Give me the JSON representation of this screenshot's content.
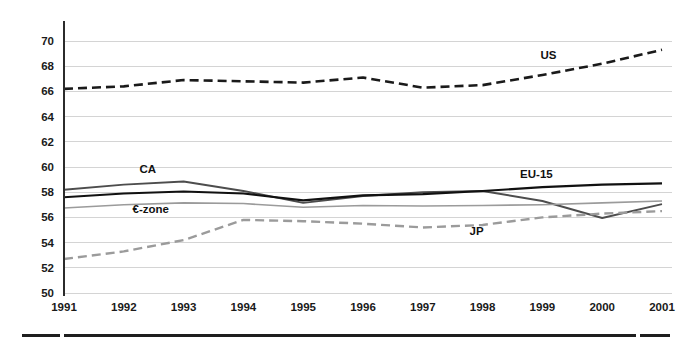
{
  "chart_data": {
    "type": "line",
    "title": "",
    "subtitle": "",
    "xlabel": "",
    "ylabel": "",
    "x": [
      1991,
      1992,
      1993,
      1994,
      1995,
      1996,
      1997,
      1998,
      1999,
      2000,
      2001
    ],
    "categories": [
      "1991",
      "1992",
      "1993",
      "1994",
      "1995",
      "1996",
      "1997",
      "1998",
      "1999",
      "2000",
      "2001"
    ],
    "xlim": [
      1991,
      2001
    ],
    "ylim": [
      50,
      70
    ],
    "ytick_values": [
      50,
      52,
      54,
      56,
      58,
      60,
      62,
      64,
      66,
      68,
      70
    ],
    "ytick_labels": [
      "50",
      "52",
      "54",
      "56",
      "58",
      "60",
      "62",
      "64",
      "66",
      "68",
      "70"
    ],
    "grid": true,
    "grid_axis": "y",
    "legend": "inline-labels",
    "legend_position": "on-plot",
    "series": [
      {
        "name": "US",
        "label": "US",
        "color": "#1a1a1a",
        "style": "dashed",
        "width": 2.6,
        "dasharray": "9,5",
        "label_x": 1999.1,
        "label_y": 68.55,
        "values": [
          66.2,
          66.4,
          66.9,
          66.8,
          66.7,
          67.1,
          66.3,
          66.5,
          67.3,
          68.2,
          69.3
        ]
      },
      {
        "name": "CA",
        "label": "CA",
        "color": "#4d4d4d",
        "style": "solid",
        "width": 1.9,
        "dasharray": "",
        "label_x": 1992.4,
        "label_y": 59.5,
        "values": [
          58.2,
          58.6,
          58.85,
          58.1,
          57.15,
          57.7,
          58.0,
          58.1,
          57.3,
          55.95,
          57.05
        ]
      },
      {
        "name": "EU-15",
        "label": "EU-15",
        "color": "#111111",
        "style": "solid",
        "width": 2.1,
        "dasharray": "",
        "label_x": 1998.9,
        "label_y": 59.1,
        "values": [
          57.6,
          57.9,
          58.05,
          57.9,
          57.35,
          57.75,
          57.85,
          58.1,
          58.4,
          58.6,
          58.7
        ]
      },
      {
        "name": "€-zone",
        "label": "€-zone",
        "color": "#9b9b9b",
        "style": "solid",
        "width": 1.6,
        "dasharray": "",
        "label_x": 1992.45,
        "label_y": 56.35,
        "values": [
          56.75,
          57.0,
          57.15,
          57.1,
          56.8,
          56.95,
          56.9,
          56.95,
          57.0,
          57.15,
          57.3
        ]
      },
      {
        "name": "JP",
        "label": "JP",
        "color": "#9b9b9b",
        "style": "dashed",
        "width": 2.4,
        "dasharray": "9,5",
        "label_x": 1997.9,
        "label_y": 54.6,
        "values": [
          52.7,
          53.3,
          54.2,
          55.8,
          55.7,
          55.5,
          55.2,
          55.4,
          56.0,
          56.3,
          56.5
        ]
      }
    ]
  },
  "axis": {
    "y_axis_name": "y-axis",
    "x_axis_name": "x-axis"
  }
}
